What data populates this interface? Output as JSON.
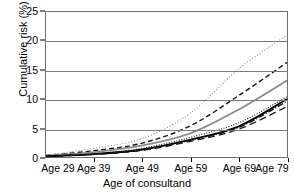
{
  "chart_data": {
    "type": "line",
    "title": "",
    "xlabel": "Age of consultand",
    "ylabel": "Cumulative risk (%)",
    "xlim": [
      29,
      79
    ],
    "ylim": [
      0,
      25
    ],
    "grid": true,
    "legend": "none",
    "x": [
      29,
      39,
      49,
      59,
      69,
      79
    ],
    "xtick_labels": [
      "Age 29",
      "Age 39",
      "Age 49",
      "Age 59",
      "Age 69",
      "Age 79"
    ],
    "ytick_labels": [
      "0",
      "5",
      "10",
      "15",
      "20",
      "25"
    ],
    "ytick_values": [
      0,
      5,
      10,
      15,
      20,
      25
    ],
    "series": [
      {
        "name": "series-1-dotted-light",
        "style": "dotted",
        "color": "#8c8c8c",
        "width": 1.1,
        "dash": "1,2",
        "values": [
          0.3,
          1.5,
          3.2,
          7.6,
          15.2,
          21.0
        ]
      },
      {
        "name": "series-2-dashed-black",
        "style": "dashed",
        "color": "#111111",
        "width": 1.4,
        "dash": "5,3",
        "values": [
          0.25,
          1.1,
          2.4,
          5.4,
          10.6,
          16.3
        ]
      },
      {
        "name": "series-3-solid-gray",
        "style": "solid",
        "color": "#8a8a8a",
        "width": 1.8,
        "dash": "none",
        "values": [
          0.2,
          0.85,
          2.0,
          4.1,
          8.2,
          13.2
        ]
      },
      {
        "name": "series-4-dotted-dark",
        "style": "dotted",
        "color": "#2a2a2a",
        "width": 1.2,
        "dash": "1,1.6",
        "values": [
          0.15,
          0.55,
          1.5,
          3.4,
          5.9,
          10.4
        ]
      },
      {
        "name": "series-5-solid-black",
        "style": "solid",
        "color": "#000000",
        "width": 1.9,
        "dash": "none",
        "values": [
          0.12,
          0.5,
          1.3,
          3.0,
          5.3,
          10.0
        ]
      },
      {
        "name": "series-6-dashdot-black",
        "style": "dash-dot",
        "color": "#141414",
        "width": 1.3,
        "dash": "6,2,1,2",
        "values": [
          0.12,
          0.48,
          1.25,
          2.9,
          5.1,
          9.6
        ]
      },
      {
        "name": "series-7-longdash-black",
        "style": "long-dash",
        "color": "#1a1a1a",
        "width": 1.3,
        "dash": "7,4",
        "values": [
          0.1,
          0.45,
          1.15,
          2.7,
          4.8,
          8.7
        ]
      }
    ]
  }
}
